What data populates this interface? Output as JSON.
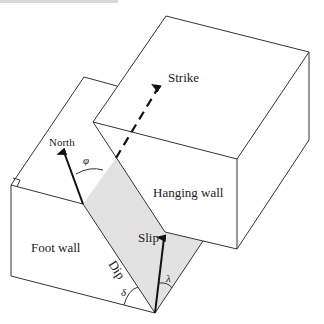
{
  "diagram": {
    "labels": {
      "strike": "Strike",
      "north": "North",
      "hanging_wall": "Hanging wall",
      "foot_wall": "Foot wall",
      "slip": "Slip",
      "dip": "Dip",
      "phi": "φ",
      "delta": "δ",
      "lambda": "λ"
    },
    "colors": {
      "line": "#333333",
      "fault_plane_fill": "#e2e2e2",
      "background": "#ffffff"
    }
  }
}
